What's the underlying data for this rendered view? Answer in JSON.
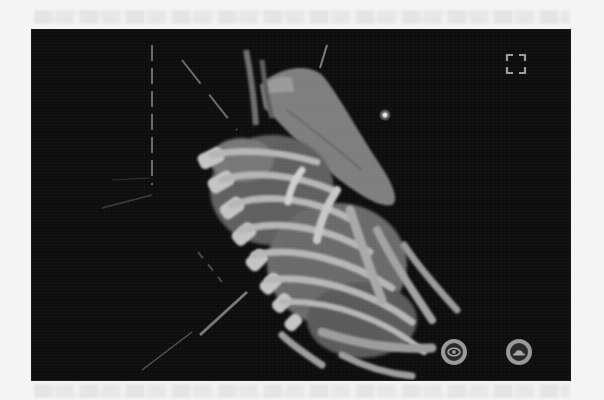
{
  "viewer": {
    "type": "3d-anatomy-viewer",
    "scene": {
      "structures": [
        "rib-cage",
        "vertebral-column",
        "lungs",
        "heart",
        "liver",
        "clavicle"
      ],
      "guides": [
        "vertical-dashed-axis",
        "diagonal-dashed-axis",
        "lower-diagonal-guide"
      ],
      "background_color": "#0d0d0d",
      "model_color": "#8c8c8c",
      "bone_color": "#bdbdbd"
    },
    "controls": {
      "fullscreen": {
        "icon": "fullscreen-icon",
        "tooltip": ""
      },
      "visibility_toggle": {
        "icon": "eye-icon"
      },
      "view_mode": {
        "icon": "hat-icon"
      }
    },
    "light_marker": {
      "icon": "light-source-icon"
    }
  }
}
